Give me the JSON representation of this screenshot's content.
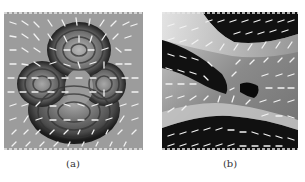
{
  "figure": {
    "panels": [
      {
        "id": "a",
        "caption": "(a)",
        "description": "Vector field (white arrow glyphs) over grayscale image of a cartoon face-like structure with concentric ring patterns",
        "background_color": "#9a9a9a"
      },
      {
        "id": "b",
        "caption": "(b)",
        "description": "Vector field (white arrow glyphs) over grayscale image with black and light regions radiating from central singular points",
        "background_color": "#8a8a8a"
      }
    ]
  }
}
